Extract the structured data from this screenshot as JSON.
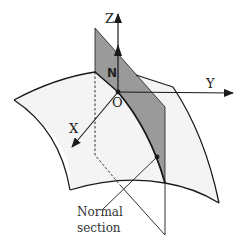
{
  "diagram": {
    "labels": {
      "z_axis": "Z",
      "y_axis": "Y",
      "x_axis": "X",
      "origin": "O",
      "normal": "N",
      "caption_line1": "Normal",
      "caption_line2": "section"
    },
    "colors": {
      "surface_fill": "#f4f4f4",
      "plane_fill": "#9a9a9a",
      "stroke": "#1a1a1a",
      "background": "#ffffff"
    }
  }
}
